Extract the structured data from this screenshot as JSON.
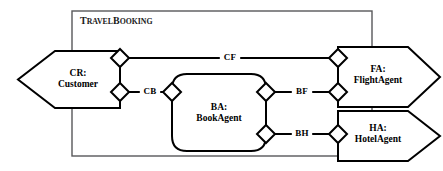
{
  "diagram": {
    "kind": "uml-component-diagram",
    "canvas": {
      "width": 443,
      "height": 171,
      "background": "#ffffff"
    },
    "line_color": "#000000",
    "frame_color": "#58585a"
  },
  "frame": {
    "name": "travel-booking-frame",
    "title_full": "TravelBooking",
    "title_part_t": "T",
    "title_part_ravel": "RAVEL",
    "title_part_b": "B",
    "title_part_ooking": "OOKING",
    "x": 72,
    "y": 11,
    "width": 300,
    "height": 145
  },
  "components": [
    {
      "id": "customer",
      "name": "component-customer",
      "shape": "flag-notched-left",
      "line1": "CR:",
      "line2": "Customer",
      "x": 18,
      "y": 51,
      "width": 102,
      "height": 57,
      "notch": 37,
      "text_cx": 78,
      "text_cy": 79
    },
    {
      "id": "bookagent",
      "name": "component-book-agent",
      "shape": "rounded-rect",
      "line1": "BA:",
      "line2": "BookAgent",
      "x": 172,
      "y": 74,
      "width": 94,
      "height": 77,
      "radius": 15,
      "text_cx": 219,
      "text_cy": 113
    },
    {
      "id": "flightagent",
      "name": "component-flight-agent",
      "shape": "arrow-right",
      "line1": "FA:",
      "line2": "FlightAgent",
      "x": 338,
      "y": 47,
      "width": 102,
      "height": 60,
      "point": 32,
      "text_cx": 378,
      "text_cy": 75
    },
    {
      "id": "hotelagent",
      "name": "component-hotel-agent",
      "shape": "arrow-right",
      "line1": "HA:",
      "line2": "HotelAgent",
      "x": 338,
      "y": 111,
      "width": 102,
      "height": 50,
      "point": 32,
      "text_cx": 378,
      "text_cy": 134
    }
  ],
  "connectors": [
    {
      "id": "cf",
      "name": "connector-cf",
      "label": "CF",
      "label_x": 230,
      "label_y": 58,
      "from": "customer",
      "to": "flightagent",
      "x1": 120,
      "y1": 58,
      "x2": 338,
      "y2": 58
    },
    {
      "id": "cb",
      "name": "connector-cb",
      "label": "CB",
      "label_x": 150,
      "label_y": 92,
      "from": "customer",
      "to": "bookagent",
      "x1": 120,
      "y1": 92,
      "x2": 172,
      "y2": 92
    },
    {
      "id": "bf",
      "name": "connector-bf",
      "label": "BF",
      "label_x": 302,
      "label_y": 92,
      "from": "bookagent",
      "to": "flightagent",
      "x1": 266,
      "y1": 92,
      "x2": 338,
      "y2": 92
    },
    {
      "id": "bh",
      "name": "connector-bh",
      "label": "BH",
      "label_x": 302,
      "label_y": 134,
      "from": "bookagent",
      "to": "hotelagent",
      "x1": 266,
      "y1": 134,
      "x2": 338,
      "y2": 134
    }
  ],
  "ports": [
    {
      "id": "p-customer-cf",
      "name": "port-customer-cf",
      "cx": 120,
      "cy": 58,
      "r": 9
    },
    {
      "id": "p-customer-cb",
      "name": "port-customer-cb",
      "cx": 120,
      "cy": 92,
      "r": 9
    },
    {
      "id": "p-bookagent-cb",
      "name": "port-book-agent-cb",
      "cx": 172,
      "cy": 92,
      "r": 9
    },
    {
      "id": "p-bookagent-bf",
      "name": "port-book-agent-bf",
      "cx": 266,
      "cy": 92,
      "r": 9
    },
    {
      "id": "p-bookagent-bh",
      "name": "port-book-agent-bh",
      "cx": 266,
      "cy": 134,
      "r": 9
    },
    {
      "id": "p-flightagent-cf",
      "name": "port-flight-agent-cf",
      "cx": 338,
      "cy": 58,
      "r": 9
    },
    {
      "id": "p-flightagent-bf",
      "name": "port-flight-agent-bf",
      "cx": 338,
      "cy": 92,
      "r": 9
    },
    {
      "id": "p-hotelagent-bh",
      "name": "port-hotel-agent-bh",
      "cx": 338,
      "cy": 134,
      "r": 9
    }
  ]
}
